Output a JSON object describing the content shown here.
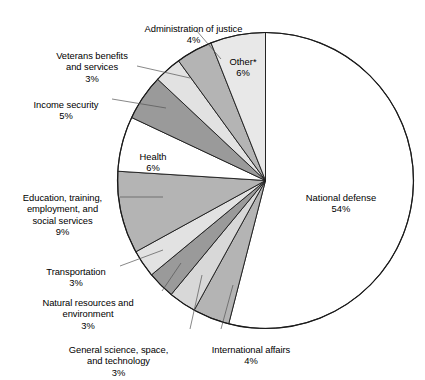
{
  "chart_data": {
    "type": "pie",
    "title": "",
    "subtitle": "",
    "xlabel": "",
    "ylabel": "",
    "legend_position": "callout-labels",
    "grid": false,
    "start_angle_deg": 0,
    "direction": "clockwise",
    "note": "Slices begin at 12 o'clock; National defense proceeds clockwise.",
    "categories": [
      "National defense",
      "International affairs",
      "General science, space, and technology",
      "Natural resources and environment",
      "Transportation",
      "Education, training, employment, and social services",
      "Health",
      "Income security",
      "Veterans benefits and services",
      "Administration of justice",
      "Other*"
    ],
    "values": [
      54,
      4,
      3,
      3,
      3,
      9,
      6,
      5,
      3,
      4,
      6
    ],
    "value_labels": [
      "54%",
      "4%",
      "3%",
      "3%",
      "3%",
      "9%",
      "6%",
      "5%",
      "3%",
      "4%",
      "6%"
    ],
    "colors": [
      "#ffffff",
      "#b4b4b4",
      "#d8d8d8",
      "#9a9a9a",
      "#e2e2e2",
      "#b4b4b4",
      "#ffffff",
      "#9a9a9a",
      "#e2e2e2",
      "#b4b4b4",
      "#e8e8e8"
    ],
    "slices": [
      {
        "label": "National defense",
        "pct": 54,
        "pct_label": "54%",
        "color": "#ffffff"
      },
      {
        "label": "International affairs",
        "pct": 4,
        "pct_label": "4%",
        "color": "#b4b4b4"
      },
      {
        "label": "General science, space, and technology",
        "pct": 3,
        "pct_label": "3%",
        "color": "#d8d8d8"
      },
      {
        "label": "Natural resources and environment",
        "pct": 3,
        "pct_label": "3%",
        "color": "#9a9a9a"
      },
      {
        "label": "Transportation",
        "pct": 3,
        "pct_label": "3%",
        "color": "#e2e2e2"
      },
      {
        "label": "Education, training, employment, and social services",
        "pct": 9,
        "pct_label": "9%",
        "color": "#b4b4b4"
      },
      {
        "label": "Health",
        "pct": 6,
        "pct_label": "6%",
        "color": "#ffffff"
      },
      {
        "label": "Income security",
        "pct": 5,
        "pct_label": "5%",
        "color": "#9a9a9a"
      },
      {
        "label": "Veterans benefits and services",
        "pct": 3,
        "pct_label": "3%",
        "color": "#e2e2e2"
      },
      {
        "label": "Administration of justice",
        "pct": 4,
        "pct_label": "4%",
        "color": "#b4b4b4"
      },
      {
        "label": "Other*",
        "pct": 6,
        "pct_label": "6%",
        "color": "#e8e8e8"
      }
    ],
    "outline_color": "#1a1a1a"
  },
  "labels": {
    "national_defense": {
      "name": "National defense",
      "pct": "54%"
    },
    "other": {
      "name": "Other*",
      "pct": "6%"
    },
    "administration_of_justice": {
      "name": "Administration of justice",
      "pct": "4%"
    },
    "veterans": {
      "name": "Veterans benefits\nand services",
      "pct": "3%"
    },
    "income_security": {
      "name": "Income security",
      "pct": "5%"
    },
    "health": {
      "name": "Health",
      "pct": "6%"
    },
    "education": {
      "name": "Education, training,\nemployment, and\nsocial services",
      "pct": "9%"
    },
    "transportation": {
      "name": "Transportation",
      "pct": "3%"
    },
    "natural_resources": {
      "name": "Natural resources and\nenvironment",
      "pct": "3%"
    },
    "general_science": {
      "name": "General science, space,\nand technology",
      "pct": "3%"
    },
    "international_affairs": {
      "name": "International affairs",
      "pct": "4%"
    }
  }
}
